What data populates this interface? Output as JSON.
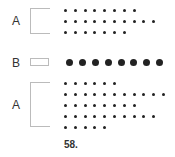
{
  "figure": {
    "caption": "58.",
    "groups": [
      {
        "label": "A",
        "dot_size": "small",
        "rows": [
          8,
          10,
          7
        ]
      },
      {
        "label": "B",
        "dot_size": "large",
        "rows": [
          8
        ]
      },
      {
        "label": "A",
        "dot_size": "small",
        "rows": [
          6,
          11,
          8,
          10,
          5
        ]
      }
    ],
    "colors": {
      "dot": "#222222",
      "bracket": "#bbbbbb",
      "text": "#333333"
    }
  }
}
